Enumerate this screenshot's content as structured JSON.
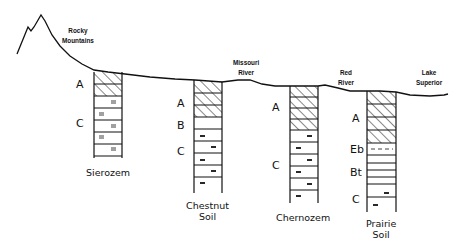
{
  "diagram": {
    "type": "soil-profile-transect",
    "landmarks": [
      {
        "id": "rocky",
        "line1": "Rocky",
        "line2": "Mountains"
      },
      {
        "id": "missouri",
        "line1": "Missouri",
        "line2": "River"
      },
      {
        "id": "red",
        "line1": "Red",
        "line2": "River"
      },
      {
        "id": "superior",
        "line1": "Lake",
        "line2": "Superior"
      }
    ],
    "profiles": [
      {
        "name_line1": "Sierozem",
        "name_line2": "",
        "horizons": [
          {
            "label": "A",
            "type": "hatched",
            "bands": 2
          },
          {
            "label": "C",
            "type": "dashed-double",
            "bands": 5
          }
        ]
      },
      {
        "name_line1": "Chestnut",
        "name_line2": "Soil",
        "horizons": [
          {
            "label": "A",
            "type": "hatched",
            "bands": 3
          },
          {
            "label": "B",
            "type": "plain",
            "bands": 1
          },
          {
            "label": "C",
            "type": "dashed",
            "bands": 5
          }
        ]
      },
      {
        "name_line1": "Chernozem",
        "name_line2": "",
        "horizons": [
          {
            "label": "A",
            "type": "hatched",
            "bands": 4
          },
          {
            "label": "C",
            "type": "dashed",
            "bands": 6
          }
        ]
      },
      {
        "name_line1": "Prairie",
        "name_line2": "Soil",
        "horizons": [
          {
            "label": "A",
            "type": "hatched",
            "bands": 4
          },
          {
            "label": "Eb",
            "type": "dashed-line",
            "bands": 1
          },
          {
            "label": "Bt",
            "type": "thin-bands",
            "bands": 4
          },
          {
            "label": "C",
            "type": "dashed",
            "bands": 2
          }
        ]
      }
    ]
  }
}
